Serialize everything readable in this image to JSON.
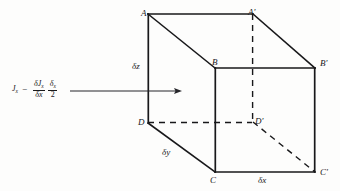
{
  "figure": {
    "type": "physics-diagram",
    "background_color": "#fdfdfc",
    "line_color": "#18181a",
    "vertices": [
      {
        "id": "A",
        "label": "A",
        "x": 141,
        "y": 9
      },
      {
        "id": "Ap",
        "label": "A'",
        "x": 248,
        "y": 8
      },
      {
        "id": "B",
        "label": "B",
        "x": 212,
        "y": 58
      },
      {
        "id": "Bp",
        "label": "B'",
        "x": 320,
        "y": 59
      },
      {
        "id": "D",
        "label": "D",
        "x": 138,
        "y": 118
      },
      {
        "id": "Dp",
        "label": "D'",
        "x": 255,
        "y": 117
      },
      {
        "id": "C",
        "label": "C",
        "x": 210,
        "y": 176
      },
      {
        "id": "Cp",
        "label": "C'",
        "x": 320,
        "y": 168
      }
    ],
    "dimensions": [
      {
        "id": "dz",
        "label": "δz",
        "x": 132,
        "y": 62,
        "edge": "A-D"
      },
      {
        "id": "dy",
        "label": "δy",
        "x": 162,
        "y": 148,
        "edge": "D-C"
      },
      {
        "id": "dx",
        "label": "δx",
        "x": 258,
        "y": 176,
        "edge": "C-C'"
      }
    ],
    "flux_label": {
      "symbol": "J",
      "symbol_subscript": "x",
      "operator": "−",
      "derivative_numerator_symbol": "δJ",
      "derivative_numerator_subscript": "x",
      "derivative_denominator_symbol": "δx",
      "half_numerator_symbol": "δ",
      "half_numerator_subscript": "x",
      "half_denominator": "2",
      "plain_text": "J_x − (δJ_x/δx)(δ_x/2)"
    },
    "arrow": {
      "id": "flux-arrow",
      "x1": 70,
      "y1": 91,
      "x2": 181,
      "y2": 91,
      "direction": "right"
    }
  }
}
